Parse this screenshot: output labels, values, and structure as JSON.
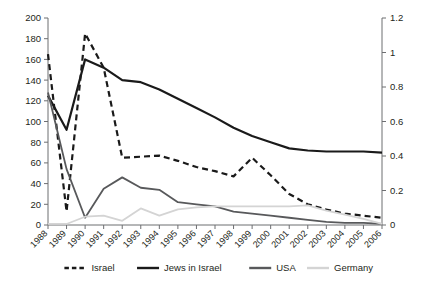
{
  "chart_data": {
    "type": "line",
    "title": "",
    "subtitle": "",
    "xlabel": "",
    "ylabel": "",
    "y2label": "",
    "grid": false,
    "legend_position": "bottom",
    "categories": [
      "1988",
      "1989",
      "1990",
      "1991",
      "1992",
      "1993",
      "1994",
      "1995",
      "1996",
      "1997",
      "1998",
      "1999",
      "2000",
      "2001",
      "2002",
      "2003",
      "2004",
      "2005",
      "2006"
    ],
    "x": [
      1988,
      1989,
      1990,
      1991,
      1992,
      1993,
      1994,
      1995,
      1996,
      1997,
      1998,
      1999,
      2000,
      2001,
      2002,
      2003,
      2004,
      2005,
      2006
    ],
    "ylim": [
      0,
      200
    ],
    "yticks": [
      0,
      20,
      40,
      60,
      80,
      100,
      120,
      140,
      160,
      180,
      200
    ],
    "y2lim": [
      0,
      1.2
    ],
    "y2ticks": [
      "0",
      "0.2",
      "0.4",
      "0.6",
      "0.8",
      "1",
      "1.2"
    ],
    "series": [
      {
        "name": "Israel",
        "axis": "left",
        "style": "dashed",
        "color": "#1a1a1a",
        "width": 2.2,
        "values": [
          165,
          13,
          185,
          152,
          65,
          66,
          67,
          62,
          56,
          52,
          47,
          65,
          48,
          30,
          20,
          15,
          11,
          9,
          7
        ]
      },
      {
        "name": "Jews in Israel",
        "axis": "left",
        "style": "solid",
        "color": "#1a1a1a",
        "width": 2.2,
        "values": [
          125,
          92,
          160,
          152,
          140,
          138,
          131,
          122,
          113,
          104,
          94,
          86,
          80,
          74,
          72,
          71,
          71,
          71,
          70
        ]
      },
      {
        "name": "USA",
        "axis": "left",
        "style": "solid",
        "color": "#58595b",
        "width": 1.8,
        "values": [
          128,
          54,
          7,
          35,
          46,
          36,
          34,
          22,
          20,
          18,
          13,
          11,
          9,
          7,
          5,
          3,
          2,
          2,
          1
        ]
      },
      {
        "name": "Germany",
        "axis": "left",
        "style": "solid",
        "color": "#d4d4d4",
        "width": 1.8,
        "values": [
          1,
          1,
          8,
          9,
          4,
          16,
          9,
          15,
          17,
          18,
          18,
          18,
          18,
          18,
          19,
          14,
          10,
          6,
          1
        ]
      }
    ],
    "legend": [
      {
        "label": "Israel",
        "style": "dashed",
        "color": "#1a1a1a"
      },
      {
        "label": "Jews in Israel",
        "style": "solid",
        "color": "#1a1a1a"
      },
      {
        "label": "USA",
        "style": "solid",
        "color": "#58595b"
      },
      {
        "label": "Germany",
        "style": "solid",
        "color": "#d4d4d4"
      }
    ]
  }
}
